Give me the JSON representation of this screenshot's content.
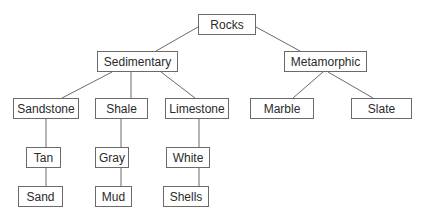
{
  "diagram": {
    "type": "tree",
    "colors": {
      "line": "#6a6a6a",
      "box_border": "#6a6a6a",
      "text": "#2a2a2a",
      "background": "#ffffff"
    },
    "nodes": [
      {
        "id": "rocks",
        "label": "Rocks",
        "x": 198,
        "y": 14,
        "w": 58,
        "h": 21
      },
      {
        "id": "sedimentary",
        "label": "Sedimentary",
        "x": 97,
        "y": 51,
        "w": 81,
        "h": 21
      },
      {
        "id": "metamorphic",
        "label": "Metamorphic",
        "x": 284,
        "y": 51,
        "w": 83,
        "h": 21
      },
      {
        "id": "sandstone",
        "label": "Sandstone",
        "x": 13,
        "y": 98,
        "w": 66,
        "h": 21
      },
      {
        "id": "shale",
        "label": "Shale",
        "x": 95,
        "y": 98,
        "w": 53,
        "h": 21
      },
      {
        "id": "limestone",
        "label": "Limestone",
        "x": 165,
        "y": 98,
        "w": 64,
        "h": 21
      },
      {
        "id": "marble",
        "label": "Marble",
        "x": 250,
        "y": 98,
        "w": 64,
        "h": 21
      },
      {
        "id": "slate",
        "label": "Slate",
        "x": 351,
        "y": 98,
        "w": 61,
        "h": 21
      },
      {
        "id": "tan",
        "label": "Tan",
        "x": 26,
        "y": 147,
        "w": 35,
        "h": 21
      },
      {
        "id": "gray",
        "label": "Gray",
        "x": 95,
        "y": 147,
        "w": 34,
        "h": 21
      },
      {
        "id": "white",
        "label": "White",
        "x": 166,
        "y": 147,
        "w": 44,
        "h": 21
      },
      {
        "id": "sand",
        "label": "Sand",
        "x": 18,
        "y": 186,
        "w": 45,
        "h": 21
      },
      {
        "id": "mud",
        "label": "Mud",
        "x": 95,
        "y": 186,
        "w": 37,
        "h": 21
      },
      {
        "id": "shells",
        "label": "Shells",
        "x": 163,
        "y": 186,
        "w": 46,
        "h": 21
      }
    ],
    "edges": [
      {
        "from": "rocks",
        "to": "sedimentary",
        "x1": 198,
        "y1": 27,
        "x2": 156,
        "y2": 51
      },
      {
        "from": "rocks",
        "to": "metamorphic",
        "x1": 256,
        "y1": 27,
        "x2": 300,
        "y2": 51
      },
      {
        "from": "sedimentary",
        "to": "sandstone",
        "x1": 112,
        "y1": 72,
        "x2": 62,
        "y2": 98
      },
      {
        "from": "sedimentary",
        "to": "shale",
        "x1": 131,
        "y1": 72,
        "x2": 131,
        "y2": 98
      },
      {
        "from": "sedimentary",
        "to": "limestone",
        "x1": 161,
        "y1": 72,
        "x2": 195,
        "y2": 98
      },
      {
        "from": "metamorphic",
        "to": "marble",
        "x1": 323,
        "y1": 72,
        "x2": 293,
        "y2": 98
      },
      {
        "from": "metamorphic",
        "to": "slate",
        "x1": 328,
        "y1": 72,
        "x2": 373,
        "y2": 98
      },
      {
        "from": "sandstone",
        "to": "tan",
        "x1": 46,
        "y1": 119,
        "x2": 46,
        "y2": 147
      },
      {
        "from": "shale",
        "to": "gray",
        "x1": 121,
        "y1": 119,
        "x2": 121,
        "y2": 147
      },
      {
        "from": "limestone",
        "to": "white",
        "x1": 199,
        "y1": 119,
        "x2": 199,
        "y2": 147
      },
      {
        "from": "tan",
        "to": "sand",
        "x1": 46,
        "y1": 168,
        "x2": 46,
        "y2": 186
      },
      {
        "from": "gray",
        "to": "mud",
        "x1": 121,
        "y1": 168,
        "x2": 121,
        "y2": 186
      },
      {
        "from": "white",
        "to": "shells",
        "x1": 199,
        "y1": 168,
        "x2": 199,
        "y2": 186
      }
    ]
  }
}
